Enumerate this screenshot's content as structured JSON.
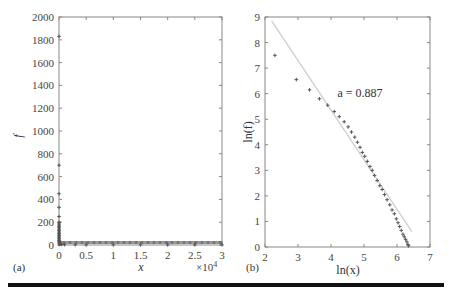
{
  "chart_data": [
    {
      "panel": "(a)",
      "type": "scatter",
      "title": "",
      "xlabel": "x",
      "ylabel": "f",
      "x_multiplier": "×10^4",
      "xlim": [
        0,
        3
      ],
      "ylim": [
        0,
        2000
      ],
      "xticks": [
        "0",
        "0.5",
        "1",
        "1.5",
        "2",
        "2.5",
        "3"
      ],
      "yticks": [
        "0",
        "200",
        "400",
        "600",
        "800",
        "1000",
        "1200",
        "1400",
        "1600",
        "1800",
        "2000"
      ],
      "grid": false,
      "marker": "+",
      "series": [
        {
          "name": "f vs x",
          "description": "Rank-frequency data: one point near 1830 at x≈0, sparse points at 700, 450, 330, 250, 200, then a dense cluster decaying rapidly to ~0 by x≈0.05×10^4, flat near 0 through x=3×10^4",
          "x": [
            0.0001,
            0.0002,
            0.0003,
            0.0004,
            0.0005,
            0.0006,
            0.0008,
            0.001,
            0.0015,
            0.002,
            0.003,
            0.005,
            0.008,
            0.012,
            0.02,
            0.03,
            0.05,
            0.1,
            0.3,
            0.5,
            1.0,
            1.5,
            2.0,
            2.5,
            3.0
          ],
          "y": [
            1830,
            700,
            450,
            330,
            250,
            200,
            160,
            130,
            100,
            80,
            60,
            40,
            30,
            20,
            12,
            8,
            5,
            3,
            2,
            1,
            1,
            1,
            1,
            1,
            1
          ]
        }
      ]
    },
    {
      "panel": "(b)",
      "type": "scatter",
      "title": "",
      "xlabel": "ln(x)",
      "ylabel": "ln(f)",
      "xlim": [
        2,
        7
      ],
      "ylim": [
        0,
        9
      ],
      "xticks": [
        "2",
        "3",
        "4",
        "5",
        "6",
        "7"
      ],
      "yticks": [
        "0",
        "1",
        "2",
        "3",
        "4",
        "5",
        "6",
        "7",
        "8",
        "9"
      ],
      "grid": false,
      "marker": "+",
      "annotation": "a = 0.887",
      "series": [
        {
          "name": "data",
          "x": [
            2.3,
            2.95,
            3.35,
            3.65,
            3.9,
            4.1,
            4.25,
            4.4,
            4.52,
            4.62,
            4.72,
            4.8,
            4.88,
            4.95,
            5.02,
            5.1,
            5.18,
            5.25,
            5.32,
            5.4,
            5.48,
            5.55,
            5.62,
            5.7,
            5.78,
            5.85,
            5.92,
            5.98,
            6.03,
            6.08,
            6.13,
            6.18,
            6.22,
            6.26,
            6.3,
            6.33,
            6.35
          ],
          "y": [
            7.5,
            6.55,
            6.15,
            5.8,
            5.55,
            5.3,
            5.1,
            4.9,
            4.7,
            4.5,
            4.3,
            4.1,
            3.9,
            3.7,
            3.55,
            3.35,
            3.15,
            3.0,
            2.8,
            2.6,
            2.4,
            2.25,
            2.05,
            1.85,
            1.65,
            1.45,
            1.3,
            1.1,
            0.95,
            0.8,
            0.65,
            0.5,
            0.4,
            0.3,
            0.2,
            0.1,
            0.05
          ]
        },
        {
          "name": "fit line",
          "type": "line",
          "color": "#cccccc",
          "x": [
            2.2,
            6.45
          ],
          "y": [
            8.85,
            0.6
          ]
        }
      ]
    }
  ],
  "labels": {
    "panel_a": "(a)",
    "panel_b": "(b)",
    "a_xlabel": "x",
    "a_ylabel": "f",
    "a_multiplier": "×10",
    "a_multiplier_exp": "4",
    "b_xlabel": "ln(x)",
    "b_ylabel": "ln(f)",
    "b_annotation": "a = 0.887"
  },
  "colors": {
    "axis": "#888888",
    "marker": "#555555",
    "fit_line": "#cccccc",
    "rule": "#111111"
  }
}
